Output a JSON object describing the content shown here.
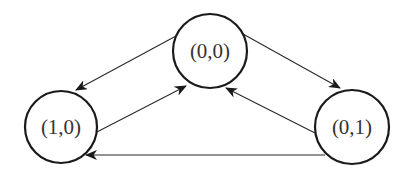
{
  "diagram": {
    "type": "state-transition-graph",
    "nodes": [
      {
        "id": "n00",
        "label": "(0,0)",
        "cx": 210,
        "cy": 51,
        "r": 37
      },
      {
        "id": "n10",
        "label": "(1,0)",
        "cx": 61,
        "cy": 127,
        "r": 36
      },
      {
        "id": "n01",
        "label": "(0,1)",
        "cx": 352,
        "cy": 127,
        "r": 37
      }
    ],
    "edges": [
      {
        "from": "(0,0)",
        "to": "(1,0)"
      },
      {
        "from": "(1,0)",
        "to": "(0,0)"
      },
      {
        "from": "(0,0)",
        "to": "(0,1)"
      },
      {
        "from": "(0,1)",
        "to": "(0,0)"
      },
      {
        "from": "(0,1)",
        "to": "(1,0)"
      }
    ],
    "colors": {
      "stroke": "#1a1a1a",
      "edge": "#2a2a2a",
      "text": "#333333",
      "background": "#ffffff"
    }
  }
}
